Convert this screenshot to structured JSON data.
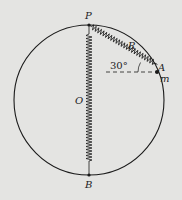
{
  "diagram": {
    "labels": {
      "P": "P",
      "O": "O",
      "B": "B",
      "R": "R",
      "A": "A",
      "m": "m",
      "angle": "30°"
    },
    "colors": {
      "background": "#e4e4e2",
      "stroke": "#1a1a1a"
    },
    "geometry": {
      "circle_center": [
        89,
        100
      ],
      "circle_radius": 75,
      "angle_deg": 30
    }
  }
}
